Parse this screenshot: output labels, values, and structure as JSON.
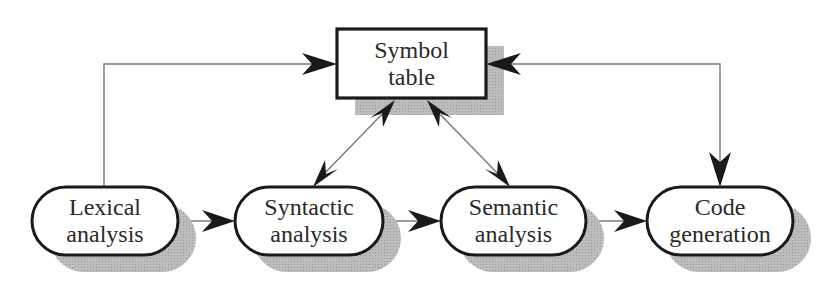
{
  "diagram": {
    "type": "compiler-phases-flow",
    "colors": {
      "stroke": "#1a1a1a",
      "connector": "#7a7a7a",
      "shadow": "#b0b0b0",
      "fill": "#ffffff"
    },
    "symbol_table": {
      "line1": "Symbol",
      "line2": "table"
    },
    "phases": [
      {
        "id": "lexical",
        "line1": "Lexical",
        "line2": "analysis"
      },
      {
        "id": "syntactic",
        "line1": "Syntactic",
        "line2": "analysis"
      },
      {
        "id": "semantic",
        "line1": "Semantic",
        "line2": "analysis"
      },
      {
        "id": "codegen",
        "line1": "Code",
        "line2": "generation"
      }
    ],
    "edges": [
      {
        "from": "Lexical analysis",
        "to": "Syntactic analysis",
        "direction": "one-way"
      },
      {
        "from": "Syntactic analysis",
        "to": "Semantic analysis",
        "direction": "one-way"
      },
      {
        "from": "Semantic analysis",
        "to": "Code generation",
        "direction": "one-way"
      },
      {
        "from": "Lexical analysis",
        "to": "Symbol table",
        "direction": "one-way"
      },
      {
        "from": "Syntactic analysis",
        "to": "Symbol table",
        "direction": "two-way"
      },
      {
        "from": "Semantic analysis",
        "to": "Symbol table",
        "direction": "two-way"
      },
      {
        "from": "Symbol table",
        "to": "Code generation",
        "direction": "two-way"
      }
    ]
  }
}
